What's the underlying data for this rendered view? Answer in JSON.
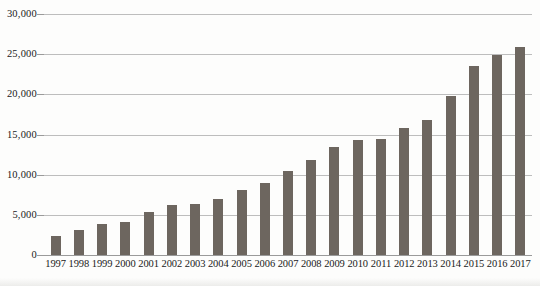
{
  "chart_data": {
    "type": "bar",
    "title": "",
    "xlabel": "",
    "ylabel": "",
    "ylim": [
      0,
      30000
    ],
    "ytick_values": [
      0,
      5000,
      10000,
      15000,
      20000,
      25000,
      30000
    ],
    "ytick_labels": [
      "0",
      "5,000",
      "10,000",
      "15,000",
      "20,000",
      "25,000",
      "30,000"
    ],
    "grid": true,
    "legend": false,
    "bar_color": "#6d665f",
    "gridline_color": "#bdbdbd",
    "background_color": "#fdfdfc",
    "categories": [
      "1997",
      "1998",
      "1999",
      "2000",
      "2001",
      "2002",
      "2003",
      "2004",
      "2005",
      "2006",
      "2007",
      "2008",
      "2009",
      "2010",
      "2011",
      "2012",
      "2013",
      "2014",
      "2015",
      "2016",
      "2017"
    ],
    "values": [
      2400,
      3100,
      3900,
      4100,
      5300,
      6200,
      6300,
      7000,
      8100,
      9000,
      10400,
      11800,
      13400,
      14300,
      14500,
      15800,
      16800,
      19800,
      23500,
      24900,
      25900
    ]
  }
}
